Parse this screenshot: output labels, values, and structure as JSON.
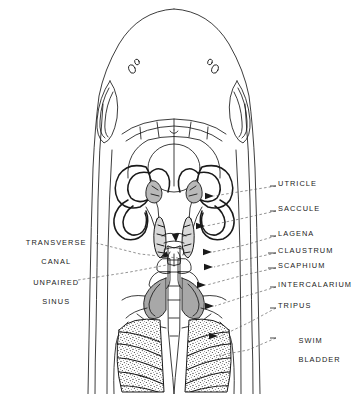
{
  "figure": {
    "type": "anatomical-line-diagram",
    "background_color": "#ffffff",
    "ink_color": "#1a1a1a",
    "shade_color": "#a8a8a8",
    "leader_style": "dashed"
  },
  "labels": {
    "right": [
      {
        "id": "utricle",
        "text": "UTRICLE",
        "x": 278,
        "y": 183,
        "lines": [
          "UTRICLE"
        ]
      },
      {
        "id": "saccule",
        "text": "SACCULE",
        "x": 278,
        "y": 208,
        "lines": [
          "SACCULE"
        ]
      },
      {
        "id": "lagena",
        "text": "LAGENA",
        "x": 278,
        "y": 234,
        "lines": [
          "LAGENA"
        ]
      },
      {
        "id": "claustrum",
        "text": "CLAUSTRUM",
        "x": 278,
        "y": 251,
        "lines": [
          "CLAUSTRUM"
        ]
      },
      {
        "id": "scaphium",
        "text": "SCAPHIUM",
        "x": 278,
        "y": 266,
        "lines": [
          "SCAPHIUM"
        ]
      },
      {
        "id": "intercalarium",
        "text": "INTERCALARIUM",
        "x": 278,
        "y": 285,
        "lines": [
          "INTERCALARIUM"
        ]
      },
      {
        "id": "tripus",
        "text": "TRIPUS",
        "x": 278,
        "y": 306,
        "lines": [
          "TRIPUS"
        ]
      },
      {
        "id": "swim-bladder",
        "text": "SWIM BLADDER",
        "x": 278,
        "y": 334,
        "lines": [
          "SWIM",
          "BLADDER"
        ]
      }
    ],
    "left": [
      {
        "id": "transverse-canal",
        "text": "TRANSVERSE CANAL",
        "x": 10,
        "y": 232,
        "lines": [
          "TRANSVERSE",
          "CANAL"
        ]
      },
      {
        "id": "unpaired-sinus",
        "text": "UNPAIRED SINUS",
        "x": 22,
        "y": 272,
        "lines": [
          "UNPAIRED",
          "SINUS"
        ]
      }
    ]
  }
}
